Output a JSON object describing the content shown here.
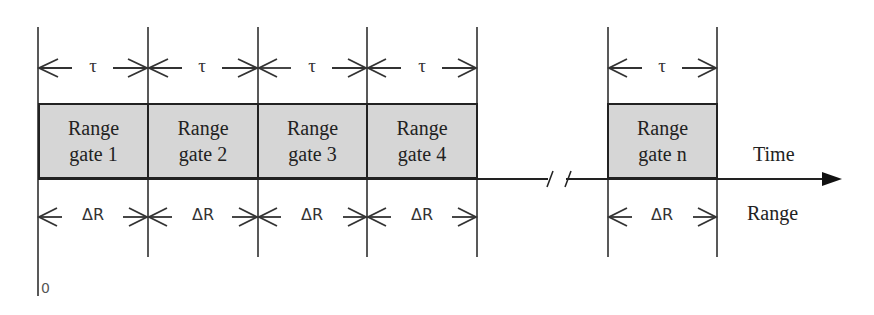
{
  "diagram": {
    "pulse_width_symbol": "τ",
    "range_resolution_symbol": "ΔR",
    "gates": [
      {
        "line1": "Range",
        "line2": "gate 1"
      },
      {
        "line1": "Range",
        "line2": "gate 2"
      },
      {
        "line1": "Range",
        "line2": "gate 3"
      },
      {
        "line1": "Range",
        "line2": "gate 4"
      },
      {
        "line1": "Range",
        "line2": "gate n"
      }
    ],
    "axis_label_top": "Time",
    "axis_label_bottom": "Range",
    "origin_label": "0",
    "break_marker": "//"
  }
}
